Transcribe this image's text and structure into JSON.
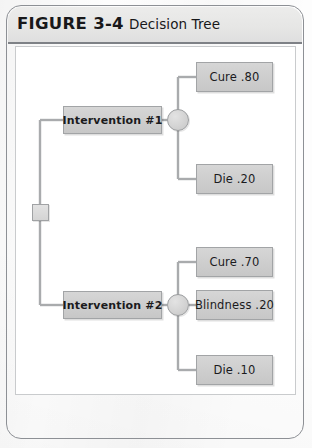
{
  "figure": {
    "label": "FIGURE 3-4",
    "title": "Decision Tree"
  },
  "colors": {
    "frame_border": "#8d9095",
    "header_band": "#e6e6e5",
    "header_rule": "#7e8186",
    "panel_background": "#ffffff",
    "panel_border": "#c9cbcd",
    "node_fill": "#cfcfcf",
    "node_border": "#a2a4a6",
    "connector_line": "#a9abad",
    "text": "#1b1b1d"
  },
  "diagram": {
    "type": "decision-tree",
    "root": {
      "name": "root-decision-node",
      "shape": "square"
    },
    "branches": [
      {
        "decision_label": "Intervention #1",
        "chance_node": "chance-node-1",
        "outcomes": [
          {
            "label": "Cure .80",
            "outcome": "Cure",
            "probability": ".80"
          },
          {
            "label": "Die .20",
            "outcome": "Die",
            "probability": ".20"
          }
        ]
      },
      {
        "decision_label": "Intervention #2",
        "chance_node": "chance-node-2",
        "outcomes": [
          {
            "label": "Cure .70",
            "outcome": "Cure",
            "probability": ".70"
          },
          {
            "label": "Blindness .20",
            "outcome": "Blindness",
            "probability": ".20"
          },
          {
            "label": "Die .10",
            "outcome": "Die",
            "probability": ".10"
          }
        ]
      }
    ]
  }
}
